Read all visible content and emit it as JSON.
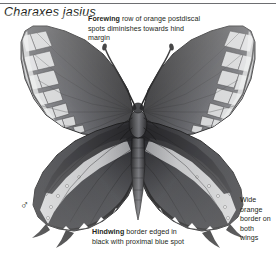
{
  "page": {
    "background_color": "#ffffff",
    "rule_color": "#6d6e71",
    "text_color": "#231f20"
  },
  "title": {
    "species": "Charaxes jasius"
  },
  "sex": {
    "symbol": "♂",
    "meaning": "male"
  },
  "captions": {
    "forewing": {
      "lead": "Forewing",
      "body": " row of orange postdiscal spots diminishes towards hind margin"
    },
    "hindwing": {
      "lead": "Hindwing",
      "body": " border edged in black with proximal blue spot"
    },
    "border": {
      "lead": "",
      "body": "Wide orange border on both wings"
    }
  },
  "specimen": {
    "name": "butterfly-specimen",
    "view": "dorsal, wings spread",
    "rendering": "grayscale photograph",
    "parts": [
      "left-forewing",
      "right-forewing",
      "left-hindwing",
      "right-hindwing",
      "thorax",
      "abdomen",
      "head",
      "antennae",
      "hindwing-tails"
    ],
    "colors": {
      "wing_dark": "#3a3a3c",
      "wing_darkest": "#1b1b1d",
      "wing_mid": "#6f7073",
      "band_light": "#c9cacb",
      "band_pale": "#e4e5e6",
      "body_dark": "#2a2a2c",
      "outline": "#151516"
    }
  }
}
